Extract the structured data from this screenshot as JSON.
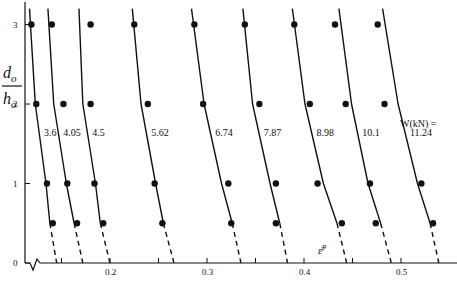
{
  "chart_data": {
    "type": "line",
    "title": "",
    "xlabel": "ε̄ᴾ",
    "ylabel": "d_o / h_o",
    "xlim": [
      0.1,
      0.56
    ],
    "ylim": [
      0,
      3.2
    ],
    "x_ticks": [
      0.2,
      0.3,
      0.4,
      0.5
    ],
    "x_tick_labels": [
      "0.2",
      "0.3",
      "0.4",
      "0.5"
    ],
    "x_minor_ticks": [
      0.15,
      0.25,
      0.35,
      0.45
    ],
    "y_ticks": [
      0,
      1,
      2,
      3
    ],
    "y_tick_labels": [
      "0",
      "1",
      "2",
      "3"
    ],
    "axis_break": true,
    "grid": false,
    "legend_title": "W(kN) =",
    "series": [
      {
        "name": "3.6",
        "label": "3.6",
        "curve": [
          [
            0.117,
            3.2
          ],
          [
            0.123,
            2
          ],
          [
            0.134,
            1
          ],
          [
            0.138,
            0.5
          ]
        ],
        "extrapolated_to_zero": 0.145,
        "points": [
          [
            0.119,
            3
          ],
          [
            0.124,
            2
          ],
          [
            0.135,
            1
          ],
          [
            0.141,
            0.5
          ]
        ]
      },
      {
        "name": "4.05",
        "label": "4.05",
        "curve": [
          [
            0.136,
            3.2
          ],
          [
            0.142,
            2
          ],
          [
            0.155,
            1
          ],
          [
            0.163,
            0.5
          ]
        ],
        "extrapolated_to_zero": 0.172,
        "points": [
          [
            0.14,
            3
          ],
          [
            0.152,
            2
          ],
          [
            0.156,
            1
          ],
          [
            0.166,
            0.5
          ]
        ]
      },
      {
        "name": "4.5",
        "label": "4.5",
        "curve": [
          [
            0.168,
            3.2
          ],
          [
            0.172,
            2
          ],
          [
            0.185,
            1
          ],
          [
            0.19,
            0.5
          ]
        ],
        "extrapolated_to_zero": 0.2,
        "points": [
          [
            0.18,
            3
          ],
          [
            0.18,
            2
          ],
          [
            0.184,
            1
          ],
          [
            0.193,
            0.5
          ]
        ]
      },
      {
        "name": "5.62",
        "label": "5.62",
        "curve": [
          [
            0.223,
            3.2
          ],
          [
            0.232,
            2
          ],
          [
            0.247,
            1
          ],
          [
            0.255,
            0.5
          ]
        ],
        "extrapolated_to_zero": 0.266,
        "points": [
          [
            0.225,
            3
          ],
          [
            0.239,
            2
          ],
          [
            0.246,
            1
          ],
          [
            0.254,
            0.5
          ]
        ]
      },
      {
        "name": "6.74",
        "label": "6.74",
        "curve": [
          [
            0.284,
            3.2
          ],
          [
            0.297,
            2
          ],
          [
            0.315,
            1
          ],
          [
            0.326,
            0.5
          ]
        ],
        "extrapolated_to_zero": 0.335,
        "points": [
          [
            0.287,
            3
          ],
          [
            0.296,
            2
          ],
          [
            0.322,
            1
          ],
          [
            0.325,
            0.5
          ]
        ]
      },
      {
        "name": "7.87",
        "label": "7.87",
        "curve": [
          [
            0.337,
            3.2
          ],
          [
            0.347,
            2
          ],
          [
            0.365,
            1
          ],
          [
            0.375,
            0.5
          ]
        ],
        "extrapolated_to_zero": 0.383,
        "points": [
          [
            0.339,
            3
          ],
          [
            0.354,
            2
          ],
          [
            0.371,
            1
          ],
          [
            0.371,
            0.5
          ]
        ]
      },
      {
        "name": "8.98",
        "label": "8.98",
        "curve": [
          [
            0.388,
            3.2
          ],
          [
            0.401,
            2
          ],
          [
            0.42,
            1
          ],
          [
            0.434,
            0.5
          ]
        ],
        "extrapolated_to_zero": 0.444,
        "points": [
          [
            0.39,
            3
          ],
          [
            0.406,
            2
          ],
          [
            0.414,
            1
          ],
          [
            0.439,
            0.5
          ]
        ]
      },
      {
        "name": "10.1",
        "label": "10.1",
        "curve": [
          [
            0.436,
            3.2
          ],
          [
            0.449,
            2
          ],
          [
            0.466,
            1
          ],
          [
            0.479,
            0.5
          ]
        ],
        "extrapolated_to_zero": 0.49,
        "points": [
          [
            0.432,
            3
          ],
          [
            0.443,
            2
          ],
          [
            0.468,
            1
          ],
          [
            0.474,
            0.5
          ]
        ]
      },
      {
        "name": "11.24",
        "label": "11.24",
        "curve": [
          [
            0.481,
            3.2
          ],
          [
            0.497,
            2
          ],
          [
            0.517,
            1
          ],
          [
            0.53,
            0.5
          ]
        ],
        "extrapolated_to_zero": 0.539,
        "points": [
          [
            0.476,
            3
          ],
          [
            0.483,
            2
          ],
          [
            0.521,
            1
          ],
          [
            0.533,
            0.5
          ]
        ]
      }
    ]
  },
  "labels": {
    "y_axis_num": "d",
    "y_axis_num_sub": "o",
    "y_axis_den": "h",
    "y_axis_den_sub": "o",
    "x_axis": "ε̄",
    "x_axis_sup": "p",
    "legend_title": "W(kN) ="
  }
}
